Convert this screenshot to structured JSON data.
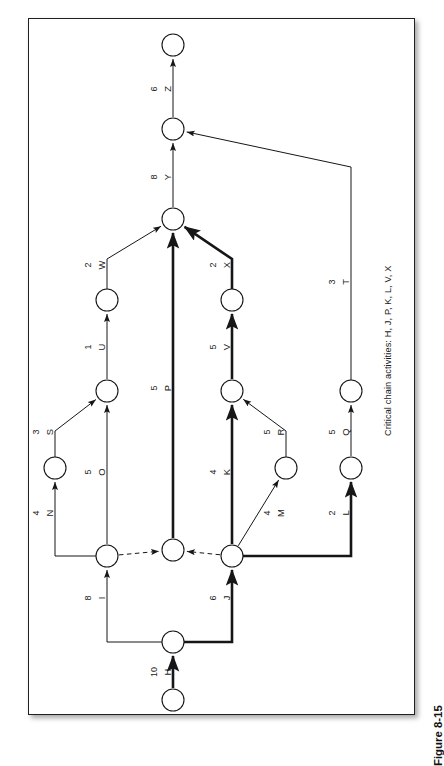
{
  "figure": {
    "number": "Figure 8-15",
    "caption": "Critical chain activities:  H, J, P, K, L, V, X"
  },
  "diagram": {
    "type": "activity-on-arrow-network",
    "orientation": "rotated-90-counterclockwise",
    "critical_chain": [
      "H",
      "J",
      "P",
      "K",
      "L",
      "V",
      "X"
    ],
    "nodes": [
      {
        "id": "n_start",
        "cx": 173,
        "cy": 700,
        "r": 11
      },
      {
        "id": "n_HJ",
        "cx": 173,
        "cy": 642,
        "r": 11
      },
      {
        "id": "n_I",
        "cx": 107,
        "cy": 556,
        "r": 11
      },
      {
        "id": "n_P0",
        "cx": 173,
        "cy": 550,
        "r": 11
      },
      {
        "id": "n_J",
        "cx": 232,
        "cy": 556,
        "r": 11
      },
      {
        "id": "n_N",
        "cx": 55,
        "cy": 468,
        "r": 11
      },
      {
        "id": "n_M",
        "cx": 286,
        "cy": 468,
        "r": 11
      },
      {
        "id": "n_L",
        "cx": 351,
        "cy": 468,
        "r": 11
      },
      {
        "id": "n_O",
        "cx": 107,
        "cy": 391,
        "r": 11
      },
      {
        "id": "n_K",
        "cx": 232,
        "cy": 391,
        "r": 11
      },
      {
        "id": "n_Q",
        "cx": 351,
        "cy": 391,
        "r": 11
      },
      {
        "id": "n_U",
        "cx": 107,
        "cy": 300,
        "r": 11
      },
      {
        "id": "n_V",
        "cx": 232,
        "cy": 300,
        "r": 11
      },
      {
        "id": "n_merge",
        "cx": 173,
        "cy": 219,
        "r": 11
      },
      {
        "id": "n_Y",
        "cx": 173,
        "cy": 129,
        "r": 11
      },
      {
        "id": "n_end",
        "cx": 173,
        "cy": 45,
        "r": 11
      }
    ],
    "edges": [
      {
        "id": "H",
        "label": "H",
        "duration": "10",
        "from": "n_start",
        "to": "n_HJ",
        "critical": true,
        "dashed": false
      },
      {
        "id": "I",
        "label": "I",
        "duration": "8",
        "from": "n_HJ",
        "to": "n_I",
        "critical": false,
        "dashed": false
      },
      {
        "id": "J",
        "label": "J",
        "duration": "6",
        "from": "n_HJ",
        "to": "n_J",
        "critical": true,
        "dashed": false
      },
      {
        "id": "d1",
        "label": "",
        "duration": "",
        "from": "n_I",
        "to": "n_P0",
        "critical": false,
        "dashed": true
      },
      {
        "id": "d2",
        "label": "",
        "duration": "",
        "from": "n_J",
        "to": "n_P0",
        "critical": false,
        "dashed": true
      },
      {
        "id": "N",
        "label": "N",
        "duration": "4",
        "from": "n_I",
        "to": "n_N",
        "critical": false,
        "dashed": false
      },
      {
        "id": "O",
        "label": "O",
        "duration": "5",
        "from": "n_I",
        "to": "n_O",
        "critical": false,
        "dashed": false
      },
      {
        "id": "S",
        "label": "S",
        "duration": "3",
        "from": "n_N",
        "to": "n_O",
        "critical": false,
        "dashed": false
      },
      {
        "id": "P",
        "label": "P",
        "duration": "5",
        "from": "n_P0",
        "to": "n_merge",
        "critical": true,
        "dashed": false
      },
      {
        "id": "K",
        "label": "K",
        "duration": "4",
        "from": "n_J",
        "to": "n_K",
        "critical": true,
        "dashed": false
      },
      {
        "id": "M",
        "label": "M",
        "duration": "4",
        "from": "n_J",
        "to": "n_M",
        "critical": false,
        "dashed": false
      },
      {
        "id": "L",
        "label": "L",
        "duration": "2",
        "from": "n_J",
        "to": "n_L",
        "critical": true,
        "dashed": false
      },
      {
        "id": "R",
        "label": "R",
        "duration": "5",
        "from": "n_M",
        "to": "n_K",
        "critical": false,
        "dashed": false
      },
      {
        "id": "Q",
        "label": "Q",
        "duration": "5",
        "from": "n_L",
        "to": "n_Q",
        "critical": false,
        "dashed": false
      },
      {
        "id": "U",
        "label": "U",
        "duration": "1",
        "from": "n_O",
        "to": "n_U",
        "critical": false,
        "dashed": false
      },
      {
        "id": "V",
        "label": "V",
        "duration": "5",
        "from": "n_K",
        "to": "n_V",
        "critical": true,
        "dashed": false
      },
      {
        "id": "T",
        "label": "T",
        "duration": "3",
        "from": "n_Q",
        "to": "n_Y",
        "critical": false,
        "dashed": false
      },
      {
        "id": "W",
        "label": "W",
        "duration": "2",
        "from": "n_U",
        "to": "n_merge",
        "critical": false,
        "dashed": false
      },
      {
        "id": "X",
        "label": "X",
        "duration": "2",
        "from": "n_V",
        "to": "n_merge",
        "critical": true,
        "dashed": false
      },
      {
        "id": "Y",
        "label": "Y",
        "duration": "8",
        "from": "n_merge",
        "to": "n_Y",
        "critical": false,
        "dashed": false
      },
      {
        "id": "Z",
        "label": "Z",
        "duration": "6",
        "from": "n_Y",
        "to": "n_end",
        "critical": false,
        "dashed": false
      }
    ],
    "edge_labels": [
      {
        "id": "H",
        "duration": "10",
        "name": "H",
        "x": 160,
        "y": 672
      },
      {
        "id": "I",
        "duration": "8",
        "name": "I",
        "x": 94,
        "y": 598
      },
      {
        "id": "J",
        "duration": "6",
        "name": "J",
        "x": 219,
        "y": 598
      },
      {
        "id": "N",
        "duration": "4",
        "name": "N",
        "x": 42,
        "y": 513
      },
      {
        "id": "O",
        "duration": "5",
        "name": "O",
        "x": 94,
        "y": 472
      },
      {
        "id": "S",
        "duration": "3",
        "name": "S",
        "x": 42,
        "y": 432
      },
      {
        "id": "P",
        "duration": "5",
        "name": "P",
        "x": 160,
        "y": 388
      },
      {
        "id": "K",
        "duration": "4",
        "name": "K",
        "x": 219,
        "y": 472
      },
      {
        "id": "M",
        "duration": "4",
        "name": "M",
        "x": 273,
        "y": 513
      },
      {
        "id": "L",
        "duration": "2",
        "name": "L",
        "x": 338,
        "y": 513
      },
      {
        "id": "R",
        "duration": "5",
        "name": "R",
        "x": 273,
        "y": 432
      },
      {
        "id": "Q",
        "duration": "5",
        "name": "Q",
        "x": 338,
        "y": 432
      },
      {
        "id": "U",
        "duration": "1",
        "name": "U",
        "x": 94,
        "y": 347
      },
      {
        "id": "V",
        "duration": "5",
        "name": "V",
        "x": 219,
        "y": 347
      },
      {
        "id": "T",
        "duration": "3",
        "name": "T",
        "x": 338,
        "y": 282
      },
      {
        "id": "W",
        "duration": "2",
        "name": "W",
        "x": 94,
        "y": 265
      },
      {
        "id": "X",
        "duration": "2",
        "name": "X",
        "x": 219,
        "y": 265
      },
      {
        "id": "Y",
        "duration": "8",
        "name": "Y",
        "x": 160,
        "y": 177
      },
      {
        "id": "Z",
        "duration": "6",
        "name": "Z",
        "x": 160,
        "y": 89
      }
    ],
    "colors": {
      "line": "#161616",
      "frame": "#231f20",
      "text": "#1a1a1a",
      "background": "#ffffff"
    }
  }
}
